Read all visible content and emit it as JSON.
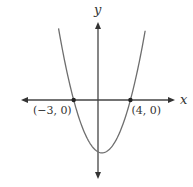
{
  "chart_data": {
    "type": "line",
    "title": "",
    "xlabel": "x",
    "ylabel": "y",
    "function": "parabola opening upward",
    "roots": [
      -3,
      4
    ],
    "vertex": {
      "x": 0.5,
      "y": -6.4
    },
    "xlim": [
      -9.5,
      9.5
    ],
    "ylim": [
      -9.5,
      9.5
    ],
    "grid": false,
    "axes_arrows": true,
    "points": [
      {
        "x": -3,
        "y": 0,
        "label": "(−3, 0)"
      },
      {
        "x": 4,
        "y": 0,
        "label": "(4, 0)"
      }
    ],
    "colors": {
      "curve": "#6e6e6e",
      "axes": "#444444",
      "points": "#222222",
      "text": "#333333"
    }
  }
}
